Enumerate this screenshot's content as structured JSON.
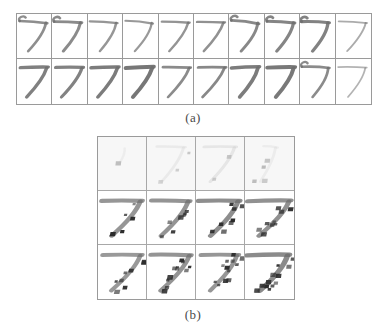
{
  "figure": {
    "background_color": "#ffffff",
    "ink_color": "#6e6e6e",
    "noise_color": "#2a2a2a",
    "border_color": "#9a9a9a",
    "top_fragment_text": ""
  },
  "captions": {
    "panel_a": "(a)",
    "panel_b": "(b)"
  },
  "panel_a": {
    "label": "(a)",
    "rows": 2,
    "cols": 10,
    "digit_class": "7",
    "description": "Two rows of ten handwritten digit 7 samples",
    "cells": [
      {
        "row": 0,
        "col": 0,
        "digit": "7",
        "style": "slanted-hooked",
        "ink": 0.78,
        "slant": -6,
        "stroke": 4.2,
        "hook": 1,
        "bar_tilt": -4,
        "crossbar": 0,
        "wobble": 1.0,
        "noise": 0
      },
      {
        "row": 0,
        "col": 1,
        "digit": "7",
        "style": "round-top",
        "ink": 0.8,
        "slant": -4,
        "stroke": 4.6,
        "hook": 1,
        "bar_tilt": -2,
        "crossbar": 0,
        "wobble": 0.6,
        "noise": 0
      },
      {
        "row": 0,
        "col": 2,
        "digit": "7",
        "style": "narrow",
        "ink": 0.72,
        "slant": -3,
        "stroke": 3.6,
        "hook": 0,
        "bar_tilt": -3,
        "crossbar": 0,
        "wobble": 0.8,
        "noise": 0
      },
      {
        "row": 0,
        "col": 3,
        "digit": "7",
        "style": "tall-thin",
        "ink": 0.7,
        "slant": -5,
        "stroke": 3.4,
        "hook": 0,
        "bar_tilt": -5,
        "crossbar": 0,
        "wobble": 1.2,
        "noise": 0
      },
      {
        "row": 0,
        "col": 4,
        "digit": "7",
        "style": "plain",
        "ink": 0.74,
        "slant": -7,
        "stroke": 3.8,
        "hook": 0,
        "bar_tilt": -2,
        "crossbar": 0,
        "wobble": 0.5,
        "noise": 0
      },
      {
        "row": 0,
        "col": 5,
        "digit": "7",
        "style": "wide-bar",
        "ink": 0.76,
        "slant": -8,
        "stroke": 3.9,
        "hook": 0,
        "bar_tilt": -1,
        "crossbar": 0,
        "wobble": 0.4,
        "noise": 0
      },
      {
        "row": 0,
        "col": 6,
        "digit": "7",
        "style": "curved",
        "ink": 0.82,
        "slant": -5,
        "stroke": 4.4,
        "hook": 1,
        "bar_tilt": -6,
        "crossbar": 0,
        "wobble": 1.4,
        "noise": 0
      },
      {
        "row": 0,
        "col": 7,
        "digit": "7",
        "style": "round-top",
        "ink": 0.84,
        "slant": -4,
        "stroke": 4.8,
        "hook": 1,
        "bar_tilt": -3,
        "crossbar": 0,
        "wobble": 0.9,
        "noise": 0
      },
      {
        "row": 0,
        "col": 8,
        "digit": "7",
        "style": "hooked",
        "ink": 0.86,
        "slant": -2,
        "stroke": 5.0,
        "hook": 1,
        "bar_tilt": -2,
        "crossbar": 0,
        "wobble": 1.1,
        "noise": 0
      },
      {
        "row": 0,
        "col": 9,
        "digit": "7",
        "style": "light-thin",
        "ink": 0.58,
        "slant": -6,
        "stroke": 2.8,
        "hook": 0,
        "bar_tilt": -3,
        "crossbar": 0,
        "wobble": 0.7,
        "noise": 0
      },
      {
        "row": 1,
        "col": 0,
        "digit": "7",
        "style": "bold-flat",
        "ink": 0.88,
        "slant": -9,
        "stroke": 5.2,
        "hook": 0,
        "bar_tilt": 1,
        "crossbar": 0,
        "wobble": 0.5,
        "noise": 0
      },
      {
        "row": 1,
        "col": 1,
        "digit": "7",
        "style": "bold-flat",
        "ink": 0.86,
        "slant": -10,
        "stroke": 5.0,
        "hook": 0,
        "bar_tilt": 0,
        "crossbar": 0,
        "wobble": 0.6,
        "noise": 0
      },
      {
        "row": 1,
        "col": 2,
        "digit": "7",
        "style": "bold-flat",
        "ink": 0.9,
        "slant": -8,
        "stroke": 5.4,
        "hook": 0,
        "bar_tilt": 1,
        "crossbar": 0,
        "wobble": 0.4,
        "noise": 0
      },
      {
        "row": 1,
        "col": 3,
        "digit": "7",
        "style": "very-bold",
        "ink": 0.94,
        "slant": -7,
        "stroke": 6.2,
        "hook": 0,
        "bar_tilt": 2,
        "crossbar": 0,
        "wobble": 0.3,
        "noise": 0
      },
      {
        "row": 1,
        "col": 4,
        "digit": "7",
        "style": "plain",
        "ink": 0.8,
        "slant": -11,
        "stroke": 4.2,
        "hook": 0,
        "bar_tilt": -1,
        "crossbar": 0,
        "wobble": 0.5,
        "noise": 0
      },
      {
        "row": 1,
        "col": 5,
        "digit": "7",
        "style": "plain",
        "ink": 0.82,
        "slant": -12,
        "stroke": 4.4,
        "hook": 0,
        "bar_tilt": 0,
        "crossbar": 0,
        "wobble": 0.4,
        "noise": 0
      },
      {
        "row": 1,
        "col": 6,
        "digit": "7",
        "style": "bold-flat",
        "ink": 0.9,
        "slant": -6,
        "stroke": 5.6,
        "hook": 0,
        "bar_tilt": 2,
        "crossbar": 0,
        "wobble": 0.6,
        "noise": 0
      },
      {
        "row": 1,
        "col": 7,
        "digit": "7",
        "style": "very-bold",
        "ink": 0.92,
        "slant": -5,
        "stroke": 6.0,
        "hook": 0,
        "bar_tilt": 1,
        "crossbar": 0,
        "wobble": 0.5,
        "noise": 0
      },
      {
        "row": 1,
        "col": 8,
        "digit": "7",
        "style": "narrow-curve",
        "ink": 0.8,
        "slant": -3,
        "stroke": 4.0,
        "hook": 1,
        "bar_tilt": -2,
        "crossbar": 0,
        "wobble": 1.3,
        "noise": 0
      },
      {
        "row": 1,
        "col": 9,
        "digit": "7",
        "style": "light-thin",
        "ink": 0.52,
        "slant": -4,
        "stroke": 2.6,
        "hook": 0,
        "bar_tilt": -1,
        "crossbar": 0,
        "wobble": 0.8,
        "noise": 0
      }
    ]
  },
  "panel_b": {
    "label": "(b)",
    "rows": 3,
    "cols": 4,
    "digit_class": "7",
    "description": "Three rows of four reconstructed digit 7 images with increasing ink and salt-and-pepper noise",
    "cells": [
      {
        "row": 0,
        "col": 0,
        "digit": "7",
        "ink": 0.22,
        "faded": true,
        "stroke": 3.0,
        "slant": -5,
        "bar_tilt": -2,
        "bar_len": 0.18,
        "stem_only": true,
        "noise": 1,
        "noise_seed": 11
      },
      {
        "row": 0,
        "col": 1,
        "digit": "7",
        "ink": 0.3,
        "faded": true,
        "stroke": 3.2,
        "slant": -7,
        "bar_tilt": -1,
        "bar_len": 0.62,
        "stem_only": false,
        "noise": 3,
        "noise_seed": 23
      },
      {
        "row": 0,
        "col": 2,
        "digit": "7",
        "ink": 0.42,
        "faded": true,
        "stroke": 3.6,
        "slant": -8,
        "bar_tilt": 0,
        "bar_len": 0.7,
        "stem_only": false,
        "noise": 2,
        "noise_seed": 37
      },
      {
        "row": 0,
        "col": 3,
        "digit": "7",
        "ink": 0.26,
        "faded": true,
        "stroke": 3.0,
        "slant": -6,
        "bar_tilt": -2,
        "bar_len": 0.3,
        "stem_only": false,
        "noise": 4,
        "noise_seed": 41
      },
      {
        "row": 1,
        "col": 0,
        "digit": "7",
        "ink": 0.72,
        "faded": false,
        "stroke": 5.4,
        "slant": -9,
        "bar_tilt": 0,
        "bar_len": 0.88,
        "stem_only": false,
        "noise": 5,
        "noise_seed": 53
      },
      {
        "row": 1,
        "col": 1,
        "digit": "7",
        "ink": 0.74,
        "faded": false,
        "stroke": 5.2,
        "slant": -8,
        "bar_tilt": -1,
        "bar_len": 0.84,
        "stem_only": false,
        "noise": 7,
        "noise_seed": 67
      },
      {
        "row": 1,
        "col": 2,
        "digit": "7",
        "ink": 0.78,
        "faded": false,
        "stroke": 5.6,
        "slant": -7,
        "bar_tilt": 0,
        "bar_len": 0.9,
        "stem_only": false,
        "noise": 8,
        "noise_seed": 79
      },
      {
        "row": 1,
        "col": 3,
        "digit": "7",
        "ink": 0.76,
        "faded": false,
        "stroke": 5.4,
        "slant": -9,
        "bar_tilt": 1,
        "bar_len": 0.92,
        "stem_only": false,
        "noise": 9,
        "noise_seed": 89
      },
      {
        "row": 2,
        "col": 0,
        "digit": "7",
        "ink": 0.7,
        "faded": false,
        "stroke": 5.0,
        "slant": -10,
        "bar_tilt": 0,
        "bar_len": 0.86,
        "stem_only": false,
        "noise": 8,
        "noise_seed": 97
      },
      {
        "row": 2,
        "col": 1,
        "digit": "7",
        "ink": 0.74,
        "faded": false,
        "stroke": 5.2,
        "slant": -9,
        "bar_tilt": -1,
        "bar_len": 0.88,
        "stem_only": false,
        "noise": 11,
        "noise_seed": 103
      },
      {
        "row": 2,
        "col": 2,
        "digit": "7",
        "ink": 0.72,
        "faded": false,
        "stroke": 5.0,
        "slant": -8,
        "bar_tilt": 0,
        "bar_len": 0.82,
        "stem_only": false,
        "noise": 12,
        "noise_seed": 113
      },
      {
        "row": 2,
        "col": 3,
        "digit": "7",
        "ink": 0.8,
        "faded": false,
        "stroke": 5.8,
        "slant": -6,
        "bar_tilt": 1,
        "bar_len": 0.9,
        "stem_only": false,
        "noise": 13,
        "noise_seed": 127
      }
    ]
  }
}
